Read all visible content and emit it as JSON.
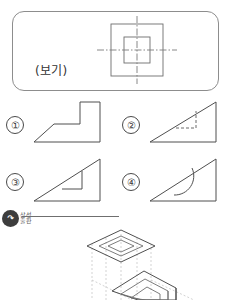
{
  "reference": {
    "label": "(보기)",
    "caption_text": "보기",
    "figure_name": "concentric-squares-with-centerlines",
    "outer_square": {
      "x": 22,
      "y": 8,
      "size": 54
    },
    "inner_square": {
      "x": 36,
      "y": 22,
      "size": 26
    },
    "centerline_horizontal": {
      "x1": 8,
      "y1": 35,
      "x2": 90,
      "y2": 35
    },
    "centerline_vertical": {
      "x1": 49,
      "y1": -4,
      "x2": 49,
      "y2": 74
    },
    "line_color": "#7a7a7a",
    "border_color": "#8d8d8d"
  },
  "options": [
    {
      "number": "①",
      "name": "option-1",
      "shape": "stepped-L-profile",
      "description": "L-shaped stepped profile with sloped lower-left edge and vertical riser",
      "has_hidden_line": false
    },
    {
      "number": "②",
      "name": "option-2",
      "shape": "right-triangle-with-dashed-square",
      "description": "Right triangle with dashed hidden square notch at inner corner",
      "has_hidden_line": true
    },
    {
      "number": "③",
      "name": "option-3",
      "shape": "right-triangle-with-solid-step",
      "description": "Right triangle with solid visible square step cut at inner corner",
      "has_hidden_line": false
    },
    {
      "number": "④",
      "name": "option-4",
      "shape": "right-triangle-with-arc",
      "description": "Right triangle with curved arc sweeping from hypotenuse to base",
      "has_hidden_line": false
    }
  ],
  "watermark": {
    "mark_glyph": "↷",
    "text": "삼성\n출판",
    "text_line1": "삼성",
    "text_line2": "출판",
    "circle_color": "#3d3d3d"
  },
  "isometric": {
    "name": "isometric-projection-diagram",
    "description": "Isometric projection showing a diamond top plane with inner diamond and a tilted lower plane with projection guide lines",
    "guide_line_color": "#c0c0c0",
    "solid_line_color": "#4f4f4f"
  },
  "colors": {
    "ink": "#4f4f4f",
    "light_ink": "#9a9a9a",
    "ghost": "#c0c0c0",
    "page_background": "#ffffff"
  }
}
